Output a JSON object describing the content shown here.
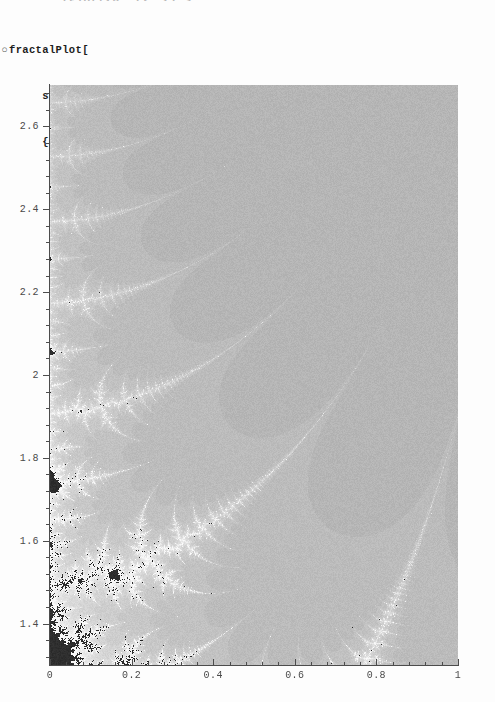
{
  "notebook": {
    "clipped_top_text": "tPlot[{0, 1}, {1.3",
    "prompt_glyph": "○",
    "code_lines": [
      "fractalPlot[",
      "     sinFractalC[{{0, 1}, {1.3, 2.7}}, 500],",
      "     {0, 20}];"
    ],
    "code_line_1": "fractalPlot[",
    "code_line_2": "     sinFractalC[{{0, 1}, {1.3, 2.7}}, 500],",
    "code_line_3": "     {0, 20}];"
  },
  "chart_data": {
    "type": "heatmap",
    "title": "",
    "subtitle": "",
    "xlabel": "",
    "ylabel": "",
    "xlim": [
      0,
      1
    ],
    "ylim": [
      1.3,
      2.7
    ],
    "grid": false,
    "legend": "none",
    "x_ticks": [
      "0",
      "0.2",
      "0.4",
      "0.6",
      "0.8",
      "1"
    ],
    "x_tick_values": [
      0,
      0.2,
      0.4,
      0.6,
      0.8,
      1
    ],
    "y_ticks": [
      "1.4",
      "1.6",
      "1.8",
      "2",
      "2.2",
      "2.4",
      "2.6"
    ],
    "y_tick_values": [
      1.4,
      1.6,
      1.8,
      2.0,
      2.2,
      2.4,
      2.6
    ],
    "minor_ticks_per_interval": 4,
    "resolution": 500,
    "iterations": 20,
    "colormap": "grayscale",
    "colors": {
      "background_field": "#3b3b3b",
      "deep_blob": "#242424",
      "escape_white": "#fdfdfd",
      "filament": "#ffffff",
      "frame": "#4c4c4c",
      "tick_label": "#4a4a4a",
      "code_text": "#1c1c1c",
      "page": "#fdfdfd"
    }
  },
  "plot_geometry": {
    "left_px": 50,
    "top_px": 85,
    "width_px": 408,
    "height_px": 580
  }
}
